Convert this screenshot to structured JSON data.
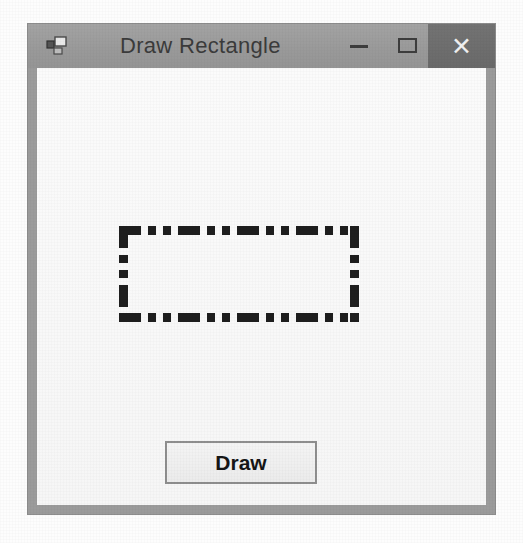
{
  "window": {
    "title": "Draw Rectangle",
    "icon": "vb-form-icon",
    "controls": {
      "minimize_label": "—",
      "minimize_name": "minimize-icon",
      "maximize_label": "□",
      "maximize_name": "maximize-icon",
      "close_label": "✕",
      "close_name": "close-icon"
    },
    "colors": {
      "titlebar": "#9b9b9b",
      "close_button": "#6d6d6d",
      "client_area": "#f8f8f8",
      "border": "#8e8e8e"
    }
  },
  "client": {
    "shape": {
      "name": "drawn-rectangle",
      "border_style": "dash-dot-dot",
      "border_color": "#1e1e1e",
      "border_width_px": 9,
      "x": 82,
      "y": 158,
      "width": 240,
      "height": 96
    },
    "draw_button": {
      "label": "Draw"
    }
  }
}
